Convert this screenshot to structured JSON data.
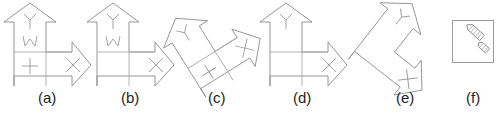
{
  "figure": {
    "kind": "multi-panel-line-diagram",
    "panel_count": 6,
    "background_color": "#ffffff",
    "stroke_color": "#8a8a8a",
    "caption_color": "#1d1d1d",
    "captions": [
      {
        "label": "(a)",
        "x": 38,
        "y": 98
      },
      {
        "label": "(b)",
        "x": 121,
        "y": 98
      },
      {
        "label": "(c)",
        "x": 208,
        "y": 98
      },
      {
        "label": "(d)",
        "x": 293,
        "y": 98
      },
      {
        "label": "(e)",
        "x": 396,
        "y": 98
      },
      {
        "label": "(f)",
        "x": 466,
        "y": 98
      }
    ],
    "panels": [
      {
        "id": "a",
        "name": "l-shaped-double-arrow-upright-full-glyphs",
        "rotation_deg": 0,
        "glyphs": [
          "Y",
          "W",
          "+",
          "X"
        ],
        "has_grid_lines": true
      },
      {
        "id": "b",
        "name": "l-shaped-double-arrow-upright-no-plus",
        "rotation_deg": 0,
        "glyphs": [
          "Y",
          "W",
          "X"
        ],
        "has_grid_lines": true
      },
      {
        "id": "c",
        "name": "l-shaped-double-arrow-rotated",
        "rotation_deg": -32,
        "glyphs": [
          "Y",
          "+",
          "X"
        ],
        "has_grid_lines": true
      },
      {
        "id": "d",
        "name": "l-shaped-double-arrow-upright-outline-only",
        "rotation_deg": 0,
        "glyphs": [
          "Y",
          "X"
        ],
        "has_grid_lines": true
      },
      {
        "id": "e",
        "name": "bent-double-arrow-rotated-no-grid",
        "rotation_deg": 38,
        "glyphs": [
          "Y",
          "X"
        ],
        "has_grid_lines": false
      },
      {
        "id": "f",
        "name": "boxed-inset-two-small-arrows",
        "rotation_deg": 0,
        "glyphs": [],
        "has_grid_lines": false,
        "box": {
          "x": 452,
          "y": 20,
          "width": 41,
          "height": 42
        },
        "items": [
          "large-pencil-arrow",
          "small-pencil-arrow"
        ]
      }
    ]
  }
}
